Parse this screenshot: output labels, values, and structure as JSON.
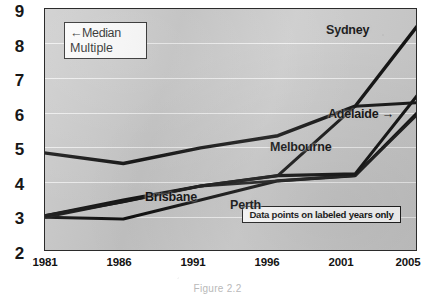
{
  "chart_data": {
    "type": "line",
    "title": "",
    "xlabel": "",
    "ylabel": "Median Multiple",
    "x": [
      1981,
      1986,
      1991,
      1996,
      2001,
      2005
    ],
    "xtick_labels": [
      "1981",
      "1986",
      "1991",
      "1996",
      "2001",
      "2005"
    ],
    "ytick_labels": [
      "9",
      "8",
      "7",
      "6",
      "5",
      "4",
      "3",
      "2"
    ],
    "ylim": [
      2,
      9
    ],
    "xlim": [
      1981,
      2005
    ],
    "grid": true,
    "legend": "inline-labels",
    "series": [
      {
        "name": "Sydney",
        "values": [
          4.85,
          4.55,
          5.0,
          5.35,
          6.2,
          8.5
        ]
      },
      {
        "name": "Adelaide",
        "values": [
          3.05,
          3.5,
          3.9,
          4.2,
          4.25,
          6.5
        ]
      },
      {
        "name": "Melbourne",
        "values": [
          3.05,
          3.45,
          3.9,
          4.2,
          6.2,
          6.3
        ]
      },
      {
        "name": "Perth",
        "values": [
          3.0,
          2.95,
          3.5,
          4.05,
          4.2,
          6.0
        ]
      },
      {
        "name": "Brisbane",
        "values": [
          3.0,
          3.45,
          3.9,
          4.05,
          4.2,
          5.95
        ]
      }
    ],
    "annotations": [
      {
        "id": "median-multiple",
        "text_line1": "←Median",
        "text_line2": "Multiple",
        "boxed": true
      },
      {
        "id": "data-points-note",
        "text": "Data points on labeled years only",
        "boxed": true
      },
      {
        "id": "adelaide-arrow",
        "text": "Adelaide →"
      }
    ],
    "series_labels": {
      "sydney": "Sydney",
      "adelaide": "Adelaide →",
      "melbourne": "Melbourne",
      "brisbane": "Brisbane",
      "perth": "Perth"
    },
    "colors": {
      "plot_background": "#c9c9c9",
      "gridline": "#f2f2f2",
      "line": "#111111",
      "axis_text": "#131313",
      "frame": "#2b2b2b"
    }
  },
  "caption": {
    "text": "Figure 2.2"
  }
}
